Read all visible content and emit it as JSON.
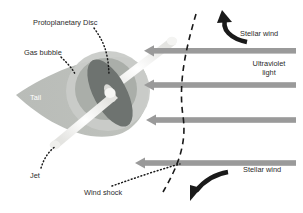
{
  "figure": {
    "type": "diagram",
    "background_color": "#ffffff"
  },
  "labels": {
    "protoplanetary_disc": "Protoplanetary Disc",
    "gas_bubble": "Gas bubble",
    "tail": "Tail",
    "jet": "Jet",
    "wind_shock": "Wind shock",
    "stellar_wind_top": "Stellar wind",
    "stellar_wind_bottom": "Stellar wind",
    "ultraviolet_light": "Ultraviolet\nlight",
    "ultraviolet_light_line1": "Ultraviolet",
    "ultraviolet_light_line2": "light"
  },
  "colors": {
    "text": "#2b2b2b",
    "tail_text": "#ffffff",
    "gas_bubble_outer": "#c9cbc8",
    "gas_bubble_inner": "#a8aca7",
    "disc": "#6e7370",
    "jet": "#f0f0ee",
    "arrow_gray": "#9a9a9a",
    "arrow_black": "#1a1a1a",
    "shock_dash": "#1a1a1a",
    "leader_dot": "#1a1a1a"
  },
  "elements": {
    "horizontal_arrows": [
      {
        "name": "stellar-wind-arrow-1",
        "y": 51,
        "x_start": 296,
        "x_end": 145,
        "color": "#9a9a9a"
      },
      {
        "name": "ultraviolet-arrow-2",
        "y": 85,
        "x_start": 296,
        "x_end": 145,
        "color": "#9a9a9a"
      },
      {
        "name": "ultraviolet-arrow-3",
        "y": 120,
        "x_start": 296,
        "x_end": 147,
        "color": "#9a9a9a"
      },
      {
        "name": "stellar-wind-arrow-4",
        "y": 163,
        "x_start": 296,
        "x_end": 136,
        "color": "#9a9a9a"
      }
    ],
    "curved_arrows": [
      {
        "name": "stellar-wind-curved-arrow-top",
        "direction": "counter-clockwise-down-left",
        "color": "#1a1a1a"
      },
      {
        "name": "stellar-wind-curved-arrow-bottom",
        "direction": "clockwise-down-left",
        "color": "#1a1a1a"
      }
    ],
    "wind_shock_curve": {
      "name": "wind-shock-dashed-curve",
      "style": "dashed",
      "color": "#1a1a1a"
    },
    "disc": {
      "name": "protoplanetary-disc",
      "cx": 110,
      "cy": 93,
      "rx": 16,
      "ry": 36,
      "rotation": -28
    },
    "gas_bubble": {
      "name": "gas-bubble",
      "cx": 106,
      "cy": 88
    },
    "tail_cone": {
      "name": "tail-cone",
      "apex_x": 16,
      "apex_y": 95
    }
  }
}
